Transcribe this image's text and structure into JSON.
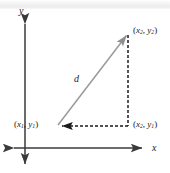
{
  "figure": {
    "width": 170,
    "height": 173,
    "background": "#ffffff"
  },
  "axes": {
    "x_axis": {
      "label": "x",
      "y_position": 148,
      "x_start": 10,
      "x_end": 145,
      "color": "#3a3a3a",
      "arrow_both_ends": true
    },
    "y_axis": {
      "label": "y",
      "x_position": 25,
      "y_start": 18,
      "y_end": 168,
      "color": "#3a3a3a",
      "arrow_both_ends": true
    }
  },
  "points": {
    "p1": {
      "label_open": "(",
      "var_x": "x",
      "sub_x": "1",
      "separator": ", ",
      "var_y": "y",
      "sub_y": "1",
      "label_close": ")",
      "px": 57,
      "py": 126
    },
    "p2": {
      "label_open": "(",
      "var_x": "x",
      "sub_x": "2",
      "separator": ", ",
      "var_y": "y",
      "sub_y": "2",
      "label_close": ")",
      "px": 128,
      "py": 33
    },
    "corner": {
      "label_open": "(",
      "var_x": "x",
      "sub_x": "2",
      "separator": ", ",
      "var_y": "y",
      "sub_y": "1",
      "label_close": ")",
      "px": 128,
      "py": 126
    }
  },
  "segments": {
    "hypotenuse": {
      "label": "d",
      "style": "solid",
      "color": "#9a9a9a",
      "arrow_at_end": true
    },
    "horizontal_leg": {
      "style": "dashed",
      "color": "#1b1b1b",
      "arrow_at_end": true,
      "dash": "3 2"
    },
    "vertical_leg": {
      "style": "dashed",
      "color": "#1b1b1b",
      "arrow_at_end": false,
      "dash": "3 2"
    }
  },
  "colors": {
    "ink": "#1b1b1b",
    "axis": "#3a3a3a",
    "hypotenuse": "#9a9a9a",
    "scan_band": "#ececed"
  }
}
